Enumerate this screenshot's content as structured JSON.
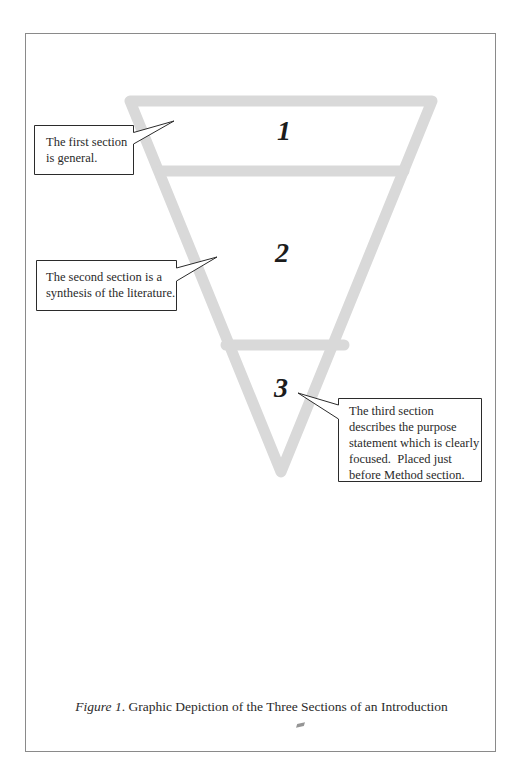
{
  "diagram": {
    "type": "inverted-funnel",
    "stroke_color": "#d9d9d9",
    "line_color": "#2b2b2b",
    "sections": [
      {
        "number": "1",
        "callout": [
          "The first section",
          "is general."
        ]
      },
      {
        "number": "2",
        "callout": [
          "The second section is a",
          "synthesis of the literature."
        ]
      },
      {
        "number": "3",
        "callout": [
          "The third section",
          "describes the purpose",
          "statement which is clearly",
          "focused.  Placed just",
          "before Method section."
        ]
      }
    ]
  },
  "caption": {
    "label": "Figure 1",
    "text": ". Graphic Depiction of the Three Sections of an Introduction"
  }
}
